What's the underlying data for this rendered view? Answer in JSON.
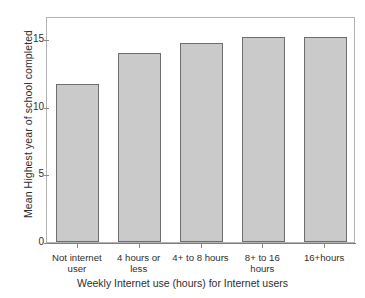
{
  "chart_data": {
    "type": "bar",
    "title": "",
    "subtitle": "",
    "xlabel": "Weekly Internet use (hours) for Internet users",
    "ylabel": "Mean Highest year of school completed",
    "categories": [
      "Not internet user",
      "4 hours or less",
      "4+ to 8 hours",
      "8+ to 16 hours",
      "16+hours"
    ],
    "category_lines": [
      [
        "Not internet",
        "user"
      ],
      [
        "4 hours or",
        "less"
      ],
      [
        "4+ to 8 hours",
        ""
      ],
      [
        "8+ to 16",
        "hours"
      ],
      [
        "16+hours",
        ""
      ]
    ],
    "values": [
      11.65,
      14.0,
      14.7,
      15.15,
      15.15
    ],
    "ylim": [
      0,
      16.7
    ],
    "yticks": [
      0,
      5,
      10,
      15
    ],
    "ytick_labels": [
      "0",
      "5",
      "10",
      "15"
    ],
    "grid": false,
    "legend": false,
    "legend_position": "none",
    "bar_fill": "#cbcbcb",
    "bar_edge": "#6e6e6e",
    "frame_color": "#b4b4b4",
    "axis_color": "#7d7d7d",
    "text_color": "#2e2e2e",
    "background": "#ffffff"
  }
}
